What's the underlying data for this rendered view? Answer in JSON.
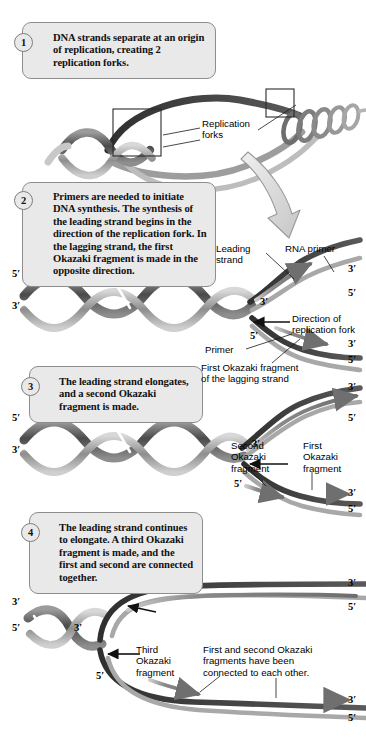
{
  "figure": {
    "colors": {
      "box_fill": "#e9e9e9",
      "box_border": "#8d8d8d",
      "strand_dark": "#3a3a3a",
      "strand_mid": "#707070",
      "strand_light": "#b8b8b8",
      "primer": "#c9c9c9",
      "arrow_gray": "#d8d8d8",
      "text": "#000000"
    }
  },
  "steps": [
    {
      "number": "1",
      "text": "DNA strands separate at an origin of replication, creating 2 replication forks."
    },
    {
      "number": "2",
      "text": "Primers are needed to initiate DNA synthesis. The synthesis of the leading strand begins in the direction of the replication fork. In the lagging strand, the first Okazaki fragment is made in the opposite direction."
    },
    {
      "number": "3",
      "text": "The leading strand elongates, and a second Okazaki fragment is made."
    },
    {
      "number": "4",
      "text": "The leading strand continues to elongate. A third Okazaki fragment is made, and the first and second are connected together."
    }
  ],
  "labels": {
    "replication_forks": "Replication\nforks",
    "leading_strand": "Leading\nstrand",
    "rna_primer": "RNA primer",
    "direction_of_fork": "Direction of\nreplication fork",
    "primer": "Primer",
    "first_okazaki_lagging": "First Okazaki fragment\nof the lagging strand",
    "second_okazaki": "Second\nOkazaki\nfragment",
    "first_okazaki": "First\nOkazaki\nfragment",
    "third_okazaki": "Third\nOkazaki\nfragment",
    "connected": "First and second Okazaki\nfragments have been\nconnected to each other."
  },
  "end_labels": {
    "five_prime": "5′",
    "three_prime": "3′"
  },
  "panel2_ticks": [
    {
      "id": "helix-left-5",
      "text": "5′"
    },
    {
      "id": "helix-left-3",
      "text": "3′"
    },
    {
      "id": "leading-3-right",
      "text": "3′"
    },
    {
      "id": "primer-5-right",
      "text": "5′"
    },
    {
      "id": "fork-3-inner",
      "text": "3′"
    },
    {
      "id": "lag-5-inner",
      "text": "5′"
    },
    {
      "id": "lag-3-right",
      "text": "3′"
    },
    {
      "id": "lag-5-right",
      "text": "5′"
    }
  ],
  "panel3_ticks": [
    {
      "id": "helix3-left-5",
      "text": "5′"
    },
    {
      "id": "helix3-left-3",
      "text": "3′"
    },
    {
      "id": "lead3-3-right",
      "text": "3′"
    },
    {
      "id": "lag3-5-right",
      "text": "5′"
    },
    {
      "id": "fork3-3-inner",
      "text": "3′"
    },
    {
      "id": "lag3-5-inner",
      "text": "5′"
    },
    {
      "id": "frag3-3-right",
      "text": "3′"
    },
    {
      "id": "frag3-5-right",
      "text": "5′"
    }
  ],
  "panel4_ticks": [
    {
      "id": "helix4-left-3",
      "text": "3′"
    },
    {
      "id": "helix4-left-5",
      "text": "5′"
    },
    {
      "id": "lead4-3-right",
      "text": "3′"
    },
    {
      "id": "lag4-5-right",
      "text": "5′"
    },
    {
      "id": "fork4-3-inner",
      "text": "3′"
    },
    {
      "id": "lag4-5-inner",
      "text": "5′"
    },
    {
      "id": "frag4-3-right",
      "text": "3′"
    },
    {
      "id": "frag4-5-right",
      "text": "5′"
    }
  ]
}
